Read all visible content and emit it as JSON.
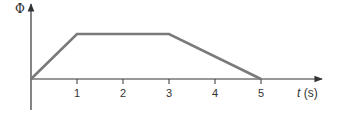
{
  "chart_data": {
    "type": "line",
    "title": "",
    "xlabel_var": "t",
    "xlabel_unit": " (s)",
    "ylabel": "Φ",
    "x": [
      0,
      1,
      3,
      5
    ],
    "series": [
      {
        "name": "Φ(t)",
        "values": [
          0,
          1,
          1,
          0
        ]
      }
    ],
    "xticks": [
      "1",
      "2",
      "3",
      "4",
      "5"
    ],
    "xlim": [
      0,
      6.3
    ],
    "ylim": [
      0,
      1.7
    ],
    "grid": false,
    "legend": "none",
    "colors": {
      "line": "#7a7a7a",
      "axis": "#333333"
    }
  }
}
